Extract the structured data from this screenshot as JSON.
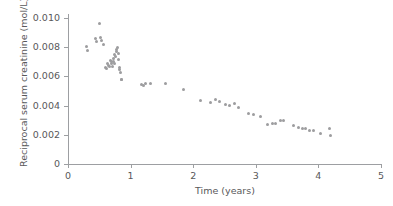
{
  "chart_data": {
    "type": "scatter",
    "title": "",
    "xlabel": "Time (years)",
    "ylabel": "Reciprocal serum creatinine (mol/L)",
    "xlim": [
      0,
      5
    ],
    "ylim": [
      0,
      0.01
    ],
    "xticks": [
      "0",
      "1",
      "2",
      "3",
      "4",
      "5"
    ],
    "xtick_values": [
      0,
      1,
      2,
      3,
      4,
      5
    ],
    "yticks": [
      "0",
      "0.002",
      "0.004",
      "0.006",
      "0.008",
      "0.010"
    ],
    "ytick_values": [
      0,
      0.002,
      0.004,
      0.006,
      0.008,
      0.01
    ],
    "grid": false,
    "legend": null,
    "marker_color": "#9d9d9f",
    "axis_color": "#9d9fa2",
    "text_color": "#58585a",
    "series": [
      {
        "name": "Reciprocal serum creatinine",
        "points": [
          [
            0.3,
            0.00803
          ],
          [
            0.31,
            0.00775
          ],
          [
            0.44,
            0.00862
          ],
          [
            0.45,
            0.0084
          ],
          [
            0.51,
            0.0096
          ],
          [
            0.52,
            0.00865
          ],
          [
            0.54,
            0.00845
          ],
          [
            0.56,
            0.00818
          ],
          [
            0.6,
            0.0066
          ],
          [
            0.61,
            0.00651
          ],
          [
            0.63,
            0.0069
          ],
          [
            0.64,
            0.00672
          ],
          [
            0.66,
            0.00665
          ],
          [
            0.68,
            0.00712
          ],
          [
            0.69,
            0.007
          ],
          [
            0.7,
            0.00686
          ],
          [
            0.71,
            0.00668
          ],
          [
            0.72,
            0.00725
          ],
          [
            0.73,
            0.00705
          ],
          [
            0.74,
            0.0069
          ],
          [
            0.75,
            0.00752
          ],
          [
            0.76,
            0.00738
          ],
          [
            0.77,
            0.0077
          ],
          [
            0.78,
            0.00785
          ],
          [
            0.79,
            0.00795
          ],
          [
            0.8,
            0.0076
          ],
          [
            0.81,
            0.00718
          ],
          [
            0.82,
            0.0066
          ],
          [
            0.83,
            0.00645
          ],
          [
            0.84,
            0.0063
          ],
          [
            0.85,
            0.00582
          ],
          [
            0.86,
            0.00578
          ],
          [
            1.18,
            0.00545
          ],
          [
            1.2,
            0.00538
          ],
          [
            1.24,
            0.00552
          ],
          [
            1.32,
            0.00551
          ],
          [
            1.56,
            0.00553
          ],
          [
            1.84,
            0.00512
          ],
          [
            2.12,
            0.00437
          ],
          [
            2.28,
            0.00418
          ],
          [
            2.36,
            0.00444
          ],
          [
            2.42,
            0.00425
          ],
          [
            2.52,
            0.00408
          ],
          [
            2.58,
            0.00402
          ],
          [
            2.66,
            0.00412
          ],
          [
            2.72,
            0.00385
          ],
          [
            2.88,
            0.00344
          ],
          [
            2.96,
            0.00341
          ],
          [
            3.08,
            0.00328
          ],
          [
            3.18,
            0.00268
          ],
          [
            3.26,
            0.00275
          ],
          [
            3.32,
            0.00278
          ],
          [
            3.4,
            0.003
          ],
          [
            3.44,
            0.00298
          ],
          [
            3.6,
            0.00265
          ],
          [
            3.68,
            0.0025
          ],
          [
            3.74,
            0.00245
          ],
          [
            3.8,
            0.0024
          ],
          [
            3.86,
            0.00232
          ],
          [
            3.92,
            0.00228
          ],
          [
            4.04,
            0.00212
          ],
          [
            4.18,
            0.0024
          ],
          [
            4.2,
            0.00196
          ]
        ]
      }
    ]
  },
  "geometry": {
    "origin_x": 68,
    "origin_y": 164,
    "px_per_x_unit": 62.6,
    "px_per_y_unit": 14600
  }
}
